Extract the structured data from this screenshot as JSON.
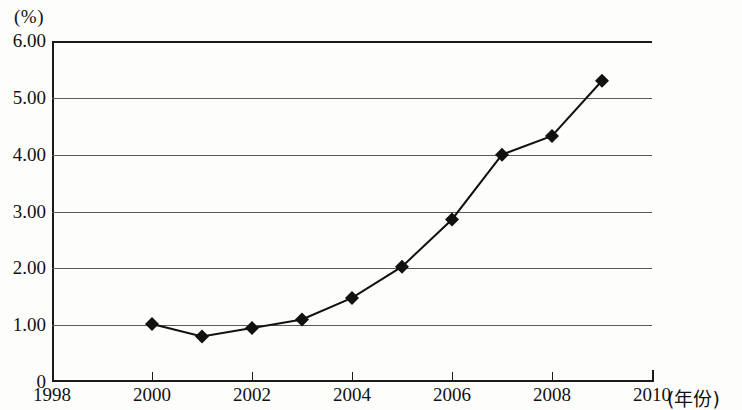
{
  "chart_data": {
    "type": "line",
    "title": "",
    "subtitle": "",
    "xlabel": "(年份)",
    "ylabel": "(%)",
    "unit_label": "(%)",
    "x_axis_name": "(年份)",
    "grid": true,
    "legend": false,
    "legend_position": "none",
    "marker": "filled-diamond",
    "line_color": "#111111",
    "marker_color": "#111111",
    "grid_color": "#5a5a5a",
    "axis_color": "#1a1a1a",
    "background_color": "#fdfdfb",
    "xlim": [
      1998,
      2010
    ],
    "ylim": [
      0,
      6
    ],
    "x_tick_labels": [
      "1998",
      "2000",
      "2002",
      "2004",
      "2006",
      "2008",
      "2010"
    ],
    "x_ticks": [
      1998,
      2000,
      2002,
      2004,
      2006,
      2008,
      2010
    ],
    "y_tick_labels": [
      "0",
      "1.00",
      "2.00",
      "3.00",
      "4.00",
      "5.00",
      "6.00"
    ],
    "y_ticks": [
      0,
      1,
      2,
      3,
      4,
      5,
      6
    ],
    "x": [
      2000,
      2001,
      2002,
      2003,
      2004,
      2005,
      2006,
      2007,
      2008,
      2009
    ],
    "values": [
      1.02,
      0.8,
      0.95,
      1.1,
      1.48,
      2.03,
      2.86,
      4.0,
      4.33,
      5.3
    ],
    "series": [
      {
        "name": "",
        "x": [
          2000,
          2001,
          2002,
          2003,
          2004,
          2005,
          2006,
          2007,
          2008,
          2009
        ],
        "values": [
          1.02,
          0.8,
          0.95,
          1.1,
          1.48,
          2.03,
          2.86,
          4.0,
          4.33,
          5.3
        ]
      }
    ],
    "annotations": []
  }
}
